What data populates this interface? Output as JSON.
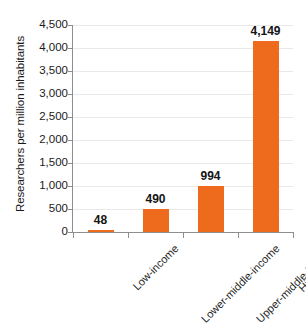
{
  "chart_data": {
    "type": "bar",
    "title": "",
    "xlabel": "",
    "ylabel": "Researchers per million inhabitants",
    "categories": [
      "Low-income",
      "Lower-middle-income",
      "Upper-middle-income",
      "High-income"
    ],
    "values": [
      48,
      490,
      994,
      4149
    ],
    "value_labels": [
      "48",
      "490",
      "994",
      "4,149"
    ],
    "ylim": [
      0,
      4500
    ],
    "ytick_labels": [
      "0",
      "500",
      "1,000",
      "1,500",
      "2,000",
      "2,500",
      "3,000",
      "3,500",
      "4,000",
      "4,500"
    ],
    "ytick_values": [
      0,
      500,
      1000,
      1500,
      2000,
      2500,
      3000,
      3500,
      4000,
      4500
    ],
    "grid": true,
    "legend": "none",
    "series": [
      {
        "name": "Researchers per million inhabitants",
        "values": [
          48,
          490,
          994,
          4149
        ],
        "color": "#ee6b1e"
      }
    ]
  },
  "colors": {
    "bar": "#ee6b1e",
    "gridline": "#e9e9e9",
    "axis": "#8e8e8e",
    "text": "#1a1a1a",
    "background": "#ffffff"
  }
}
